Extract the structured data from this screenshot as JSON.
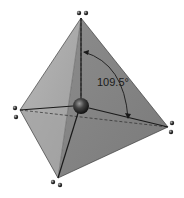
{
  "diagram": {
    "angle_label": "109.5°",
    "shape": "tetrahedron",
    "central_atom": "sphere",
    "vertices": [
      {
        "name": "top",
        "x": 81,
        "y": 18,
        "lone_pair": [
          [
            79,
            13
          ],
          [
            86,
            13
          ]
        ]
      },
      {
        "name": "left",
        "x": 20,
        "y": 110,
        "lone_pair": [
          [
            15,
            108
          ],
          [
            16,
            117
          ]
        ]
      },
      {
        "name": "right",
        "x": 168,
        "y": 127,
        "lone_pair": [
          [
            172,
            123
          ],
          [
            171,
            132
          ]
        ]
      },
      {
        "name": "bottom",
        "x": 58,
        "y": 178,
        "lone_pair": [
          [
            53,
            182
          ],
          [
            60,
            185
          ]
        ]
      }
    ],
    "center": {
      "x": 81,
      "y": 106,
      "r": 8
    },
    "colors": {
      "face_left": "#a8a8a8",
      "face_right": "#8a8a8a",
      "face_bottom": "#7e7e7e",
      "edge": "#1e1e1e",
      "sphere": "#3a3a3a",
      "dot": "#222222"
    }
  }
}
